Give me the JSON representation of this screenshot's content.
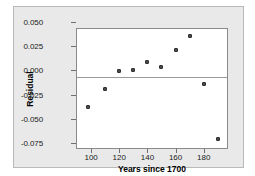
{
  "chart_data": {
    "type": "scatter",
    "title": "",
    "xlabel": "Years since 1700",
    "ylabel": "Residual",
    "xlim": [
      80,
      188
    ],
    "ylim": [
      -0.075,
      0.05
    ],
    "grid": false,
    "legend": null,
    "reference_line": 0.0,
    "x": [
      88,
      100,
      110,
      120,
      130,
      140,
      150,
      160,
      170,
      180
    ],
    "y": [
      -0.031,
      -0.012,
      0.007,
      0.008,
      0.016,
      0.011,
      0.028,
      0.043,
      -0.007,
      -0.064
    ],
    "points": [
      {
        "x": 88,
        "y": -0.031
      },
      {
        "x": 100,
        "y": -0.012
      },
      {
        "x": 110,
        "y": 0.007
      },
      {
        "x": 120,
        "y": 0.008
      },
      {
        "x": 130,
        "y": 0.016
      },
      {
        "x": 140,
        "y": 0.011
      },
      {
        "x": 150,
        "y": 0.028
      },
      {
        "x": 160,
        "y": 0.043
      },
      {
        "x": 170,
        "y": -0.007
      },
      {
        "x": 180,
        "y": -0.064
      }
    ],
    "xticks": [
      100,
      120,
      140,
      160,
      180
    ],
    "xtick_labels": [
      "100",
      "120",
      "140",
      "160",
      "180"
    ],
    "yticks": [
      0.05,
      0.025,
      0.0,
      -0.025,
      -0.05,
      -0.075
    ],
    "ytick_labels": [
      "0.050",
      "0.025",
      "0.000",
      "-0.025",
      "-0.050",
      "-0.075"
    ],
    "marker_color": "#4a4a4a",
    "reference_line_color": "#9a9a9a",
    "plot_background": "#ffffff",
    "panel_background": "#e9e9e9"
  }
}
